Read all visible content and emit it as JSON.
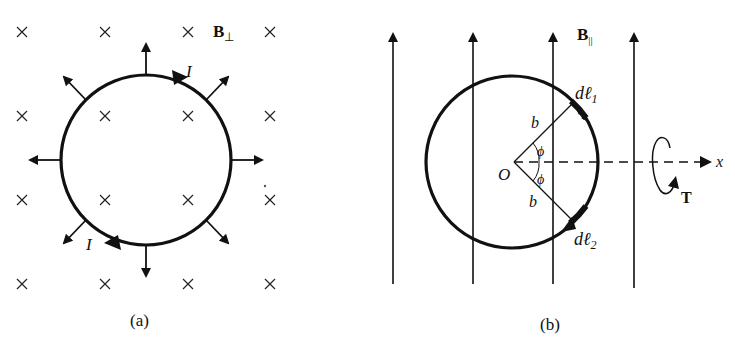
{
  "panel_a": {
    "caption": "(a)",
    "field_label": "B",
    "field_subscript": "⊥",
    "current_label_top": "I",
    "current_label_bottom": "I",
    "field_symbol": "×",
    "description": "Circular current loop in perpendicular field (into page); radial outward force arrows"
  },
  "panel_b": {
    "caption": "(b)",
    "field_label": "B",
    "field_subscript": "||",
    "dl1_label": "dℓ",
    "dl1_sub": "1",
    "dl2_label": "dℓ",
    "dl2_sub": "2",
    "radius_label_top": "b",
    "radius_label_bottom": "b",
    "angle_label_top": "ϕ",
    "angle_label_bottom": "ϕ",
    "origin_label": "O",
    "axis_label": "x",
    "torque_label": "T",
    "description": "Circular loop in parallel field (vertical lines upward); torque about x-axis"
  },
  "colors": {
    "ink": "#111111",
    "background": "#ffffff"
  }
}
